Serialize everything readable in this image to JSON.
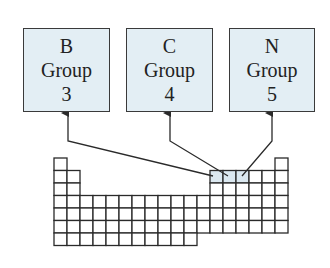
{
  "boxes": [
    {
      "element": "B",
      "group_label": "Group",
      "group_number": "3",
      "left": 23,
      "top": 28,
      "width": 87,
      "height": 84,
      "arrow_x": 68,
      "target": [
        213,
        176
      ]
    },
    {
      "element": "C",
      "group_label": "Group",
      "group_number": "4",
      "left": 126,
      "top": 28,
      "width": 87,
      "height": 84,
      "arrow_x": 170,
      "target": [
        228,
        176
      ]
    },
    {
      "element": "N",
      "group_label": "Group",
      "group_number": "5",
      "left": 229,
      "top": 28,
      "width": 86,
      "height": 84,
      "arrow_x": 272,
      "target": [
        242,
        176
      ]
    }
  ],
  "periodic_table": {
    "origin_x": 54,
    "origin_y": 158,
    "cell_w": 13,
    "cell_h": 12.5,
    "rows": [
      [
        1,
        18
      ],
      [
        1,
        2,
        13,
        14,
        15,
        16,
        17,
        18
      ],
      [
        1,
        2,
        13,
        14,
        15,
        16,
        17,
        18
      ],
      [
        1,
        2,
        3,
        4,
        5,
        6,
        7,
        8,
        9,
        10,
        11,
        12,
        13,
        14,
        15,
        16,
        17,
        18
      ],
      [
        1,
        2,
        3,
        4,
        5,
        6,
        7,
        8,
        9,
        10,
        11,
        12,
        13,
        14,
        15,
        16,
        17,
        18
      ],
      [
        1,
        2,
        3,
        4,
        5,
        6,
        7,
        8,
        9,
        10,
        11,
        12,
        13,
        14,
        15,
        16,
        17,
        18
      ],
      [
        1,
        2,
        3,
        4,
        5,
        6,
        7,
        8,
        9,
        10,
        11
      ]
    ],
    "highlighted": [
      [
        2,
        13
      ],
      [
        2,
        14
      ],
      [
        2,
        15
      ]
    ],
    "highlight_color": "#dbe8f0",
    "line_color": "#2a2a2a"
  },
  "colors": {
    "box_fill": "#e3eef4",
    "box_border": "#3a3a3a",
    "arrow": "#2a2a2a"
  }
}
